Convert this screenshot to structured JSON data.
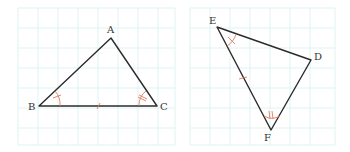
{
  "diagram": {
    "type": "geometry-congruent-triangles",
    "colors": {
      "grid": "#dff3f3",
      "side": "#2b2b2b",
      "mark": "#e07a5f",
      "label": "#333333"
    },
    "triangles": [
      {
        "name": "triangle-ABC",
        "vertices": {
          "A": {
            "label": "A",
            "x": 111,
            "y": 38
          },
          "B": {
            "label": "B",
            "x": 39,
            "y": 106
          },
          "C": {
            "label": "C",
            "x": 157,
            "y": 106
          }
        },
        "marks": {
          "angle_B": "single-arc-single-tick",
          "angle_C": "single-arc-double-tick",
          "side_BC": "single-tick"
        }
      },
      {
        "name": "triangle-EDF",
        "vertices": {
          "E": {
            "label": "E",
            "x": 217,
            "y": 27
          },
          "D": {
            "label": "D",
            "x": 311,
            "y": 60
          },
          "F": {
            "label": "F",
            "x": 271,
            "y": 130
          }
        },
        "marks": {
          "angle_E": "single-arc-single-tick",
          "angle_F": "single-arc-double-tick",
          "side_EF": "single-tick"
        }
      }
    ]
  }
}
